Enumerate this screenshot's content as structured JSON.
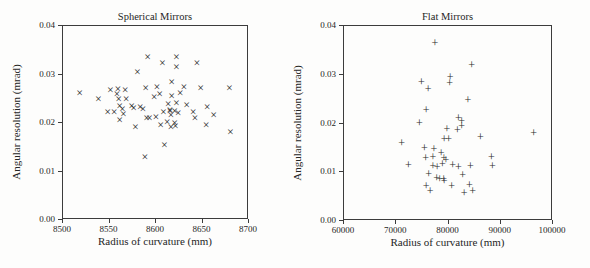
{
  "figure": {
    "background": "#fdfdfc",
    "line_color": "#3c3c3c",
    "marker_color": "#2a2a2a"
  },
  "chart_data": [
    {
      "type": "scatter",
      "title": "Spherical Mirrors",
      "xlabel": "Radius of curvature (mm)",
      "ylabel": "Angular resolution (mrad)",
      "marker": "x",
      "marker_glyph": "×",
      "xlim": [
        8500,
        8700
      ],
      "ylim": [
        0.0,
        0.04
      ],
      "xtick_labels": [
        "8500",
        "8550",
        "8600",
        "8650",
        "8700"
      ],
      "ytick_labels": [
        "0.00",
        "0.01",
        "0.02",
        "0.03",
        "0.04"
      ],
      "grid": false,
      "legend": null,
      "points": [
        [
          8519,
          0.026
        ],
        [
          8539,
          0.0248
        ],
        [
          8549,
          0.022
        ],
        [
          8552,
          0.0267
        ],
        [
          8556,
          0.022
        ],
        [
          8559,
          0.0257
        ],
        [
          8560,
          0.0268
        ],
        [
          8561,
          0.0248
        ],
        [
          8562,
          0.0232
        ],
        [
          8562,
          0.0204
        ],
        [
          8565,
          0.0226
        ],
        [
          8566,
          0.0216
        ],
        [
          8568,
          0.0266
        ],
        [
          8569,
          0.0248
        ],
        [
          8575,
          0.0232
        ],
        [
          8577,
          0.0228
        ],
        [
          8579,
          0.0189
        ],
        [
          8581,
          0.0304
        ],
        [
          8584,
          0.0231
        ],
        [
          8587,
          0.0226
        ],
        [
          8589,
          0.0128
        ],
        [
          8590,
          0.027
        ],
        [
          8591,
          0.0209
        ],
        [
          8592,
          0.0333
        ],
        [
          8594,
          0.0208
        ],
        [
          8599,
          0.0252
        ],
        [
          8601,
          0.021
        ],
        [
          8602,
          0.0272
        ],
        [
          8605,
          0.0257
        ],
        [
          8606,
          0.0193
        ],
        [
          8608,
          0.0321
        ],
        [
          8609,
          0.0221
        ],
        [
          8610,
          0.0152
        ],
        [
          8613,
          0.0199
        ],
        [
          8614,
          0.0238
        ],
        [
          8616,
          0.0225
        ],
        [
          8616,
          0.0223
        ],
        [
          8617,
          0.0214
        ],
        [
          8617,
          0.019
        ],
        [
          8618,
          0.0254
        ],
        [
          8618,
          0.0283
        ],
        [
          8621,
          0.0222
        ],
        [
          8621,
          0.0197
        ],
        [
          8622,
          0.0191
        ],
        [
          8623,
          0.0334
        ],
        [
          8623,
          0.0314
        ],
        [
          8623,
          0.024
        ],
        [
          8625,
          0.0218
        ],
        [
          8627,
          0.0259
        ],
        [
          8631,
          0.0272
        ],
        [
          8634,
          0.0235
        ],
        [
          8641,
          0.0221
        ],
        [
          8643,
          0.0209
        ],
        [
          8645,
          0.0321
        ],
        [
          8649,
          0.027
        ],
        [
          8655,
          0.0193
        ],
        [
          8656,
          0.023
        ],
        [
          8663,
          0.0215
        ],
        [
          8680,
          0.0271
        ],
        [
          8681,
          0.0179
        ]
      ]
    },
    {
      "type": "scatter",
      "title": "Flat Mirrors",
      "xlabel": "Radius of curvature (mm)",
      "ylabel": "Angular resolution (mrad)",
      "marker": "+",
      "marker_glyph": "+",
      "xlim": [
        60000,
        100000
      ],
      "ylim": [
        0.0,
        0.04
      ],
      "xtick_labels": [
        "60000",
        "70000",
        "80000",
        "90000",
        "100000"
      ],
      "ytick_labels": [
        "0.00",
        "0.01",
        "0.02",
        "0.03",
        "0.04"
      ],
      "grid": false,
      "legend": null,
      "points": [
        [
          71200,
          0.0157
        ],
        [
          72500,
          0.0112
        ],
        [
          74600,
          0.0199
        ],
        [
          75000,
          0.0284
        ],
        [
          75600,
          0.0148
        ],
        [
          75800,
          0.0127
        ],
        [
          75900,
          0.007
        ],
        [
          75900,
          0.0226
        ],
        [
          76300,
          0.0269
        ],
        [
          76400,
          0.0094
        ],
        [
          76700,
          0.006
        ],
        [
          77200,
          0.013
        ],
        [
          77200,
          0.0111
        ],
        [
          77400,
          0.0145
        ],
        [
          77600,
          0.0364
        ],
        [
          77900,
          0.0086
        ],
        [
          78000,
          0.0108
        ],
        [
          78500,
          0.0084
        ],
        [
          78800,
          0.0137
        ],
        [
          79000,
          0.0114
        ],
        [
          79250,
          0.0084
        ],
        [
          79380,
          0.008
        ],
        [
          79300,
          0.0128
        ],
        [
          79700,
          0.0123
        ],
        [
          79350,
          0.0167
        ],
        [
          79900,
          0.0187
        ],
        [
          80200,
          0.0167
        ],
        [
          80400,
          0.0282
        ],
        [
          80500,
          0.0293
        ],
        [
          80800,
          0.0069
        ],
        [
          81000,
          0.0112
        ],
        [
          81900,
          0.0184
        ],
        [
          82100,
          0.0209
        ],
        [
          82100,
          0.0108
        ],
        [
          82700,
          0.0204
        ],
        [
          82700,
          0.0193
        ],
        [
          82900,
          0.0093
        ],
        [
          83200,
          0.0056
        ],
        [
          83900,
          0.0247
        ],
        [
          84200,
          0.0071
        ],
        [
          84400,
          0.011
        ],
        [
          84600,
          0.0317
        ],
        [
          84800,
          0.006
        ],
        [
          86300,
          0.017
        ],
        [
          88400,
          0.013
        ],
        [
          88600,
          0.011
        ],
        [
          96500,
          0.0178
        ]
      ]
    }
  ]
}
